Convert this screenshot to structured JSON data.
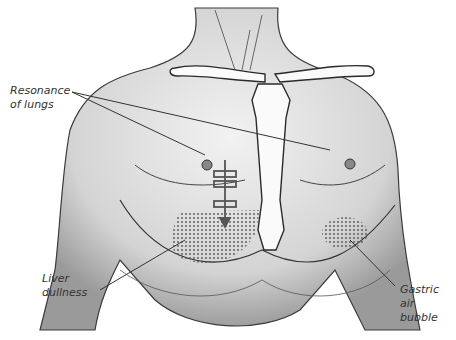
{
  "figure": {
    "labels": [
      {
        "id": "resonance",
        "line1": "Resonance",
        "line2": "of lungs"
      },
      {
        "id": "liver",
        "line1": "Liver",
        "line2": "dullness"
      },
      {
        "id": "gastric",
        "line1": "Gastric air",
        "line2": "bubble"
      }
    ]
  },
  "colors": {
    "skin_shadow": "#9a9a9a",
    "outline": "#2a2a2a",
    "marker": "#555555",
    "label_text": "#333333"
  }
}
